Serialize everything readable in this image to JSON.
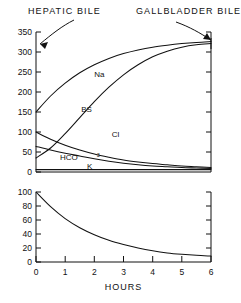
{
  "figure": {
    "annotations": [
      {
        "name": "hepatic-bile",
        "text": "HEPATIC BILE",
        "x": 28,
        "y": 12
      },
      {
        "name": "gallbladder-bile",
        "text": "GALLBLADDER BILE",
        "x": 136,
        "y": 12
      }
    ],
    "xlabel": "HOURS"
  },
  "chart_data": [
    {
      "type": "line",
      "name": "electrolyte-concentrations",
      "title": "",
      "xlabel": "HOURS",
      "ylabel": "",
      "xlim": [
        0,
        6
      ],
      "ylim": [
        0,
        350
      ],
      "xticks": [
        0,
        1,
        2,
        3,
        4,
        5,
        6
      ],
      "yticks": [
        0,
        50,
        100,
        150,
        200,
        250,
        300,
        350
      ],
      "yticklabels": [
        "0",
        "50",
        "100",
        "150",
        "200",
        "250",
        "300",
        "350"
      ],
      "xticklabels": [
        "",
        "",
        "",
        "",
        "",
        "",
        ""
      ],
      "grid": false,
      "legend": "inline-labels",
      "x": [
        0,
        0.5,
        1,
        1.5,
        2,
        2.5,
        3,
        3.5,
        4,
        4.5,
        5,
        5.5,
        6
      ],
      "series": [
        {
          "name": "Na",
          "label": "Na",
          "label_x": 2.0,
          "label_y": 238,
          "values": [
            150,
            190,
            222,
            248,
            268,
            284,
            296,
            305,
            312,
            317,
            321,
            324,
            326
          ]
        },
        {
          "name": "BS",
          "label": "BS",
          "label_x": 1.55,
          "label_y": 150,
          "values": [
            35,
            60,
            96,
            136,
            176,
            212,
            243,
            268,
            288,
            302,
            312,
            318,
            321
          ]
        },
        {
          "name": "Cl",
          "label": "Cl",
          "label_x": 2.6,
          "label_y": 88,
          "values": [
            100,
            82,
            67,
            55,
            45,
            37,
            30,
            25,
            21,
            18,
            15,
            13,
            11
          ]
        },
        {
          "name": "HCO3",
          "label": "HCO",
          "label_sub": "3",
          "label_x": 1.45,
          "label_y": 42,
          "values": [
            64,
            55,
            47,
            40,
            33,
            27,
            22,
            18,
            15,
            13,
            11,
            10,
            9
          ]
        },
        {
          "name": "K",
          "label": "K",
          "label_x": 1.75,
          "label_y": 7,
          "values": [
            6,
            6,
            6,
            6,
            6,
            6,
            6,
            6,
            6,
            6,
            6,
            6,
            6
          ]
        }
      ]
    },
    {
      "type": "line",
      "name": "volume-decay",
      "title": "",
      "xlabel": "HOURS",
      "ylabel": "",
      "xlim": [
        0,
        6
      ],
      "ylim": [
        0,
        100
      ],
      "xticks": [
        0,
        1,
        2,
        3,
        4,
        5,
        6
      ],
      "yticks": [
        0,
        20,
        40,
        60,
        80,
        100
      ],
      "yticklabels": [
        "0",
        "20",
        "40",
        "60",
        "80",
        "100"
      ],
      "xticklabels": [
        "0",
        "1",
        "2",
        "3",
        "4",
        "5",
        "6"
      ],
      "grid": false,
      "legend": "none",
      "x": [
        0,
        0.5,
        1,
        1.5,
        2,
        2.5,
        3,
        3.5,
        4,
        4.5,
        5,
        5.5,
        6
      ],
      "series": [
        {
          "name": "volume",
          "label": "",
          "values": [
            100,
            79,
            62,
            49,
            39,
            31,
            25,
            20,
            16,
            13,
            11,
            9.5,
            8.5
          ]
        }
      ]
    }
  ],
  "colors": {
    "ink": "#111111",
    "background": "#ffffff"
  }
}
